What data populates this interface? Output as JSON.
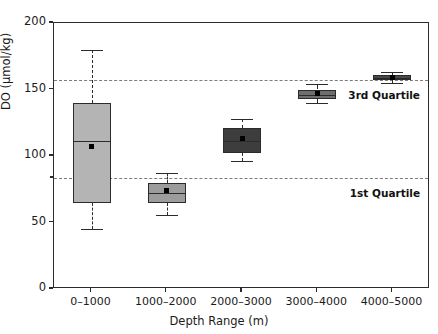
{
  "chart_data": {
    "type": "box",
    "title": "",
    "xlabel": "Depth Range (m)",
    "ylabel": "DO (μmol/kg)",
    "ylim": [
      0,
      200
    ],
    "yticks": [
      0,
      50,
      100,
      150,
      200
    ],
    "ytick_labels": [
      "0",
      "50",
      "100",
      "150",
      "200"
    ],
    "grid": false,
    "legend": "none",
    "categories": [
      "0–1000",
      "1000–2000",
      "2000–3000",
      "3000–4000",
      "4000–5000"
    ],
    "boxes": [
      {
        "category": "0–1000",
        "whisker_low": 45,
        "q1": 65,
        "median": 111,
        "q3": 140,
        "whisker_high": 180,
        "mean": 107,
        "fill": "#b4b4b4"
      },
      {
        "category": "1000–2000",
        "whisker_low": 56,
        "q1": 65,
        "median": 72,
        "q3": 80,
        "whisker_high": 87,
        "mean": 74,
        "fill": "#9c9c9c"
      },
      {
        "category": "2000–3000",
        "whisker_low": 96,
        "q1": 102,
        "median": 111,
        "q3": 121,
        "whisker_high": 128,
        "mean": 113,
        "fill": "#3d3d3d"
      },
      {
        "category": "3000–4000",
        "whisker_low": 140,
        "q1": 143,
        "median": 146,
        "q3": 150,
        "whisker_high": 154,
        "mean": 147,
        "fill": "#6e6e6e"
      },
      {
        "category": "4000–5000",
        "whisker_low": 155,
        "q1": 157,
        "median": 159,
        "q3": 161,
        "whisker_high": 163,
        "mean": 159,
        "fill": "#4a4a4a"
      }
    ],
    "reference_lines": [
      {
        "label": "3rd Quartile",
        "value": 157
      },
      {
        "label": "1st Quartile",
        "value": 83.5
      }
    ],
    "colors": {
      "axis": "#2b2b2b",
      "reference_line": "#7c7c7c",
      "mean_marker": "#000000",
      "text": "#1b1b1b"
    }
  }
}
